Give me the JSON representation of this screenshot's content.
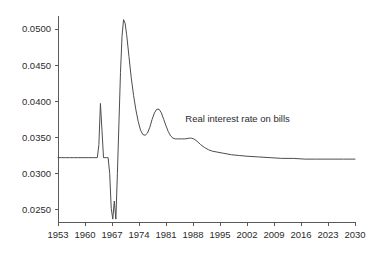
{
  "chart_data": {
    "type": "line",
    "title": "",
    "subtitle": "",
    "xlabel": "",
    "ylabel": "",
    "grid": false,
    "legend_position": "inline-annotation",
    "annotations": [
      {
        "name": "series-label",
        "text": "Real interest rate on bills",
        "x": 1986,
        "y": 0.0371
      }
    ],
    "xlim": [
      1953,
      2030
    ],
    "ylim": [
      0.0233,
      0.0518
    ],
    "xticks": [
      1953,
      1960,
      1967,
      1974,
      1981,
      1988,
      1995,
      2002,
      2009,
      2016,
      2023,
      2030
    ],
    "xtick_labels": [
      "1953",
      "1960",
      "1967",
      "1974",
      "1981",
      "1988",
      "1995",
      "2002",
      "2009",
      "2016",
      "2023",
      "2030"
    ],
    "yticks": [
      0.025,
      0.03,
      0.035,
      0.04,
      0.045,
      0.05
    ],
    "ytick_labels": [
      "0.0250",
      "0.0300",
      "0.0350",
      "0.0400",
      "0.0450",
      "0.0500"
    ],
    "line_color": "#4d4d4d",
    "axis_color": "#5a5a5a",
    "background_color": "#ffffff",
    "series": [
      {
        "name": "Real interest rate on bills",
        "x": [
          1953,
          1954,
          1955,
          1956,
          1957,
          1958,
          1959,
          1960,
          1961,
          1962,
          1962.6,
          1963.2,
          1963.6,
          1964.0,
          1964.4,
          1964.8,
          1965.2,
          1965.6,
          1966.0,
          1966.4,
          1966.8,
          1967.2,
          1967.6,
          1968.0,
          1968.4,
          1968.8,
          1969.2,
          1969.6,
          1970.0,
          1970.4,
          1970.8,
          1971.4,
          1972.0,
          1972.6,
          1973.2,
          1973.8,
          1974.4,
          1975.0,
          1975.6,
          1976.2,
          1976.8,
          1977.4,
          1978.0,
          1978.6,
          1979.2,
          1979.8,
          1980.4,
          1981.0,
          1981.6,
          1982.2,
          1982.8,
          1983.4,
          1984.0,
          1985.0,
          1986.0,
          1987.0,
          1987.6,
          1988.2,
          1989.0,
          1990.0,
          1991.0,
          1992.0,
          1993.0,
          1994.0,
          1995.0,
          1996.0,
          1998.0,
          2000.0,
          2002.0,
          2005.0,
          2008.0,
          2011.0,
          2014.0,
          2017.0,
          2020.0,
          2024.0,
          2027.0,
          2030.0
        ],
        "y": [
          0.0322,
          0.0322,
          0.0322,
          0.0322,
          0.0322,
          0.0322,
          0.0322,
          0.0322,
          0.0322,
          0.0322,
          0.0322,
          0.0322,
          0.034,
          0.0397,
          0.036,
          0.0322,
          0.0322,
          0.0322,
          0.0322,
          0.03,
          0.0252,
          0.0237,
          0.0262,
          0.0237,
          0.03,
          0.037,
          0.044,
          0.049,
          0.0513,
          0.0508,
          0.0492,
          0.0462,
          0.0432,
          0.0408,
          0.0388,
          0.0372,
          0.036,
          0.0354,
          0.0353,
          0.0356,
          0.0364,
          0.0375,
          0.0384,
          0.0389,
          0.0389,
          0.0384,
          0.0375,
          0.0366,
          0.0358,
          0.0352,
          0.0349,
          0.0348,
          0.0348,
          0.0348,
          0.0348,
          0.0349,
          0.0349,
          0.0348,
          0.0345,
          0.034,
          0.0336,
          0.0333,
          0.0331,
          0.033,
          0.0329,
          0.0328,
          0.0326,
          0.0325,
          0.0324,
          0.0323,
          0.0322,
          0.0321,
          0.0321,
          0.032,
          0.032,
          0.032,
          0.032,
          0.032
        ]
      }
    ]
  },
  "plot_geometry": {
    "left": 58,
    "right": 355,
    "top": 16,
    "bottom": 222,
    "y_at_top_value": 0.0518,
    "y_at_bottom_value": 0.0233
  }
}
